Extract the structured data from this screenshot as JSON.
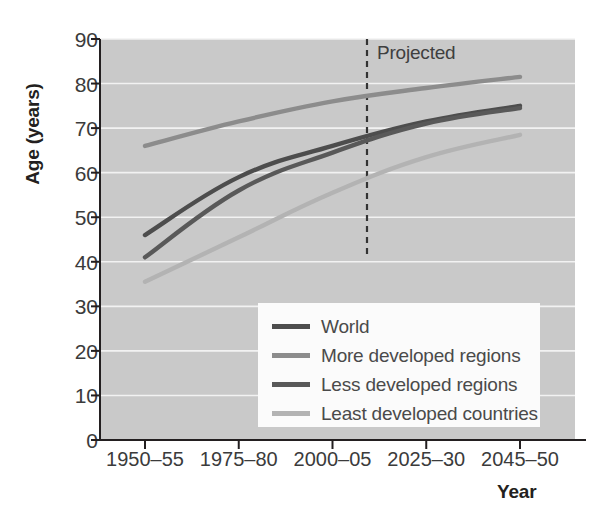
{
  "chart_data": {
    "type": "line",
    "title": "",
    "xlabel": "Year",
    "ylabel": "Age (years)",
    "categories": [
      "1950–55",
      "1975–80",
      "2000–05",
      "2025–30",
      "2045–50"
    ],
    "ylim": [
      0,
      90
    ],
    "yticks": [
      0,
      10,
      20,
      30,
      40,
      50,
      60,
      70,
      80,
      90
    ],
    "ytick_labels": [
      "0",
      "10",
      "20",
      "30",
      "40",
      "50",
      "60",
      "70",
      "80",
      "90"
    ],
    "grid": "horizontal",
    "legend_position": "lower-center",
    "plot_background": "#c9c9c9",
    "gridline_color": "#f2f2f2",
    "annotations": [
      {
        "text": "Projected",
        "type": "vertical-dashed-line",
        "x_category_between": "2000–05 and 2025–30",
        "x_value": 2010,
        "line_color": "#333333"
      }
    ],
    "series": [
      {
        "name": "World",
        "color": "#4d4d4d",
        "values": [
          46.0,
          59.0,
          66.0,
          71.5,
          75.0
        ]
      },
      {
        "name": "More developed regions",
        "color": "#8c8c8c",
        "values": [
          66.0,
          71.5,
          76.0,
          79.0,
          81.5
        ]
      },
      {
        "name": "Less developed regions",
        "color": "#595959",
        "values": [
          41.0,
          56.0,
          64.5,
          71.0,
          74.5
        ]
      },
      {
        "name": "Least developed countries",
        "color": "#b3b3b3",
        "values": [
          35.5,
          45.5,
          55.5,
          63.5,
          68.5
        ]
      }
    ]
  },
  "axes": {
    "y_title": "Age (years)",
    "x_title": "Year"
  },
  "legend": {
    "entries": [
      {
        "label": "World",
        "color": "#4d4d4d"
      },
      {
        "label": "More developed regions",
        "color": "#8c8c8c"
      },
      {
        "label": "Less developed regions",
        "color": "#595959"
      },
      {
        "label": "Least developed countries",
        "color": "#b3b3b3"
      }
    ]
  },
  "annotation": {
    "projected_label": "Projected"
  }
}
